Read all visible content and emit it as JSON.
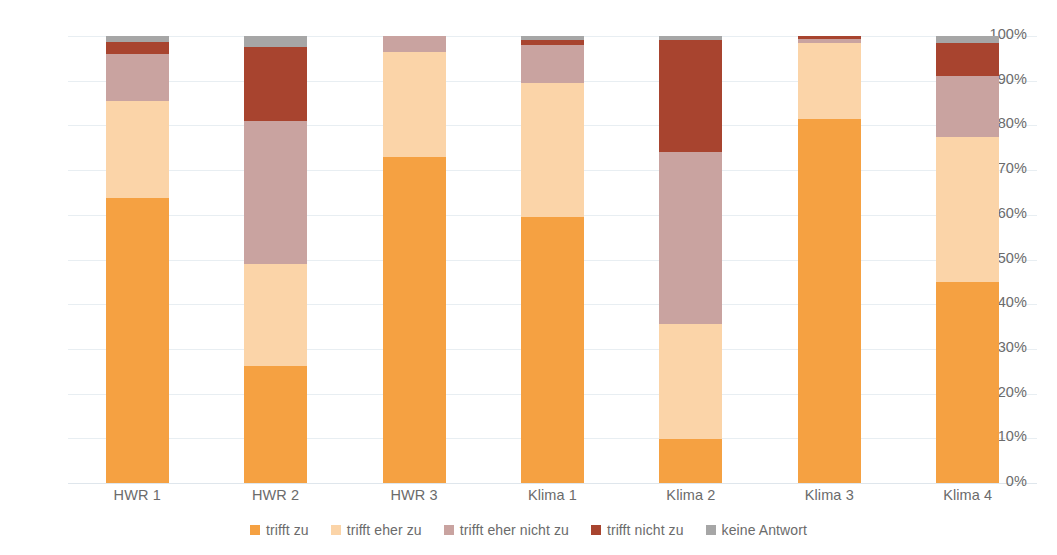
{
  "chart_data": {
    "type": "bar",
    "subtype": "stacked-100-percent",
    "title": "",
    "xlabel": "",
    "ylabel": "",
    "ylim": [
      0,
      100
    ],
    "grid": true,
    "legend_position": "bottom",
    "categories": [
      "HWR 1",
      "HWR 2",
      "HWR 3",
      "Klima 1",
      "Klima 2",
      "Klima 3",
      "Klima 4"
    ],
    "y_ticks": [
      "0%",
      "10%",
      "20%",
      "30%",
      "40%",
      "50%",
      "60%",
      "70%",
      "80%",
      "90%",
      "100%"
    ],
    "y_tick_values": [
      0,
      10,
      20,
      30,
      40,
      50,
      60,
      70,
      80,
      90,
      100
    ],
    "series": [
      {
        "name": "trifft zu",
        "color": "#F5A142",
        "values": [
          63.7,
          26.2,
          72.9,
          59.6,
          9.8,
          81.5,
          45.0
        ]
      },
      {
        "name": "trifft eher zu",
        "color": "#FBD4A8",
        "values": [
          21.8,
          22.9,
          23.6,
          29.9,
          25.7,
          17.0,
          32.5
        ]
      },
      {
        "name": "trifft eher nicht zu",
        "color": "#C9A3A0",
        "values": [
          10.5,
          32.0,
          3.5,
          8.5,
          38.5,
          0.9,
          13.5
        ]
      },
      {
        "name": "trifft nicht zu",
        "color": "#A8442F",
        "values": [
          2.6,
          16.4,
          0.0,
          1.1,
          25.0,
          0.6,
          7.5
        ]
      },
      {
        "name": "keine Antwort",
        "color": "#A6A6A6",
        "values": [
          1.4,
          2.5,
          0.0,
          0.9,
          1.0,
          0.0,
          1.5
        ]
      }
    ]
  },
  "legend": {
    "items": [
      {
        "label": "trifft zu",
        "color": "#F5A142"
      },
      {
        "label": "trifft eher zu",
        "color": "#FBD4A8"
      },
      {
        "label": "trifft eher nicht zu",
        "color": "#C9A3A0"
      },
      {
        "label": "trifft nicht zu",
        "color": "#A8442F"
      },
      {
        "label": "keine Antwort",
        "color": "#A6A6A6"
      }
    ]
  },
  "colors": {
    "gridline": "#E8EEF2",
    "axis_text": "#6B6B6B",
    "background": "#FFFFFF"
  }
}
